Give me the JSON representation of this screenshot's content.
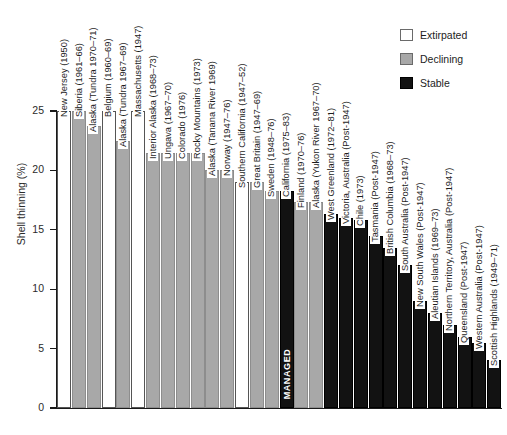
{
  "chart_data": {
    "type": "bar",
    "title": "",
    "xlabel": "",
    "ylabel": "Shell thinning (%)",
    "ylim": [
      0,
      25
    ],
    "yticks": [
      0,
      5,
      10,
      15,
      20,
      25
    ],
    "ytick_labels": [
      "0",
      "5",
      "10",
      "15",
      "20",
      "25"
    ],
    "grid": false,
    "legend_position": "top-right",
    "legend": [
      {
        "label": "Extirpated",
        "color": "#ffffff",
        "status": "extirpated"
      },
      {
        "label": "Declining",
        "color": "#a8a8a8",
        "status": "declining"
      },
      {
        "label": "Stable",
        "color": "#121212",
        "status": "stable"
      }
    ],
    "annotations": [
      {
        "text": "MANAGED",
        "on_category": "California (1975–83)"
      }
    ],
    "categories": [
      "New Jersey (1950)",
      "Siberia (1961–66)",
      "Alaska (Tundra 1970–71)",
      "Belgium (1960–69)",
      "Alaska (Tundra 1967–69)",
      "Massachusetts (1947)",
      "Interior Alaska (1968–73)",
      "Ungava (1967–70)",
      "Colorado (1976)",
      "Rocky Mountains (1973)",
      "Alaska (Tanana River 1969)",
      "Norway (1947–76)",
      "Southern California (1947–52)",
      "Great Britain (1947–69)",
      "Sweden (1948–76)",
      "California (1975–83)",
      "Finland (1970–76)",
      "Alaska (Yukon River 1967–70)",
      "West Greenland (1972–81)",
      "Victoria, Australia (Post-1947)",
      "Chile (1973)",
      "Tasmania (Post-1947)",
      "British Columbia (1968–73)",
      "South Australia (Post-1947)",
      "New South Wales (Post-1947)",
      "Aleutian Islands (1969–73)",
      "Northern Territory, Australia (Post-1947)",
      "Queensland (Post-1947)",
      "Western Australia (Post-1947)",
      "Scottish Highlands (1949–71)"
    ],
    "values": [
      25.0,
      25.0,
      23.7,
      25.0,
      22.5,
      25.0,
      21.5,
      21.5,
      21.5,
      21.5,
      20.0,
      20.0,
      19.0,
      19.0,
      18.3,
      18.3,
      17.3,
      17.3,
      16.3,
      16.0,
      15.8,
      14.5,
      13.5,
      12.0,
      9.0,
      8.0,
      7.0,
      6.0,
      5.5,
      4.0
    ],
    "statuses": [
      "extirpated",
      "declining",
      "declining",
      "extirpated",
      "declining",
      "extirpated",
      "declining",
      "declining",
      "declining",
      "declining",
      "declining",
      "declining",
      "extirpated",
      "declining",
      "declining",
      "stable",
      "declining",
      "declining",
      "stable",
      "stable",
      "stable",
      "stable",
      "stable",
      "stable",
      "stable",
      "stable",
      "stable",
      "stable",
      "stable",
      "stable"
    ]
  }
}
